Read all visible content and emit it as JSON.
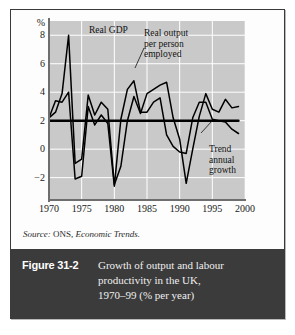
{
  "figure": {
    "number_label": "Figure 31-2",
    "caption_lines": [
      "Growth of output and labour",
      "productivity in the UK,",
      "1970–99 (% per year)"
    ],
    "source_prefix": "Source:",
    "source_org": "ONS,",
    "source_publication": "Economic Trends."
  },
  "annotations": {
    "real_gdp": "Real GDP",
    "real_output_per_person": [
      "Real output",
      "per person",
      "employed"
    ],
    "trend": [
      "Trend",
      "annual",
      "growth"
    ]
  },
  "colors": {
    "plot_background": "#c9c9c9",
    "gridline": "#ffffff",
    "series_line": "#000000",
    "axis": "#6e6e6e",
    "caption_bar": "#3b3b3b",
    "caption_text": "#efefef",
    "panel_border": "#3a3a3a"
  },
  "chart_data": {
    "type": "line",
    "title": "Growth of output and labour productivity in the UK, 1970–99 (% per year)",
    "xlabel": "",
    "ylabel": "%",
    "xlim": [
      1970,
      2000
    ],
    "ylim": [
      -3.5,
      9.0
    ],
    "xticks": [
      1970,
      1975,
      1980,
      1985,
      1990,
      1995,
      2000
    ],
    "yticks": [
      -2,
      0,
      2,
      4,
      6,
      8
    ],
    "ytick_labels": [
      "−2",
      "0",
      "2",
      "4",
      "6",
      "8"
    ],
    "grid": true,
    "grid_axis": "both",
    "legend": "none (inline annotations)",
    "x": [
      1970,
      1971,
      1972,
      1973,
      1974,
      1975,
      1976,
      1977,
      1978,
      1979,
      1980,
      1981,
      1982,
      1983,
      1984,
      1985,
      1986,
      1987,
      1988,
      1989,
      1990,
      1991,
      1992,
      1993,
      1994,
      1995,
      1996,
      1997,
      1998,
      1999
    ],
    "series": [
      {
        "name": "Real GDP",
        "values": [
          2.2,
          2.6,
          3.9,
          8.0,
          -1.0,
          -0.7,
          3.8,
          2.4,
          3.3,
          2.8,
          -2.5,
          -1.2,
          2.0,
          3.7,
          2.5,
          3.9,
          4.2,
          4.5,
          4.7,
          2.2,
          0.7,
          -2.4,
          0.0,
          2.3,
          3.9,
          2.8,
          2.6,
          3.5,
          2.9,
          3.0
        ]
      },
      {
        "name": "Real output per person employed",
        "values": [
          2.2,
          3.4,
          3.3,
          4.0,
          -2.1,
          -1.9,
          3.0,
          1.7,
          2.4,
          1.8,
          -2.6,
          2.1,
          4.2,
          4.8,
          2.6,
          2.6,
          3.3,
          3.6,
          1.0,
          0.2,
          -0.2,
          -0.3,
          2.2,
          3.3,
          3.3,
          2.1,
          2.0,
          1.9,
          1.4,
          1.1
        ]
      },
      {
        "name": "Trend annual growth",
        "constant_value": 2.0,
        "values": [
          2.0,
          2.0,
          2.0,
          2.0,
          2.0,
          2.0,
          2.0,
          2.0,
          2.0,
          2.0,
          2.0,
          2.0,
          2.0,
          2.0,
          2.0,
          2.0,
          2.0,
          2.0,
          2.0,
          2.0,
          2.0,
          2.0,
          2.0,
          2.0,
          2.0,
          2.0,
          2.0,
          2.0,
          2.0,
          2.0
        ]
      }
    ]
  }
}
